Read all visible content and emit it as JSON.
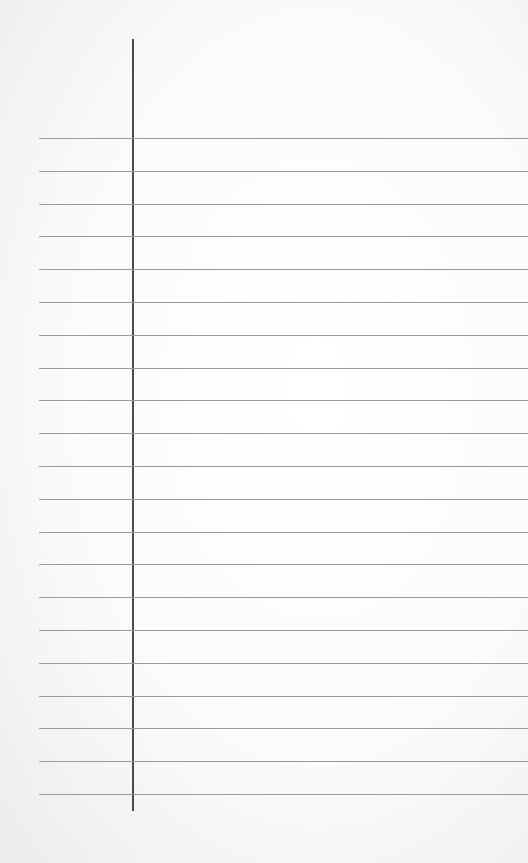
{
  "paper": {
    "type": "lined notebook paper",
    "background_color": "#fbfbfb",
    "rule_color": "#9a9a9a",
    "margin_color": "#4a4a4a",
    "rule_count": 21,
    "first_rule_y": 138,
    "rule_spacing": 32.8
  }
}
